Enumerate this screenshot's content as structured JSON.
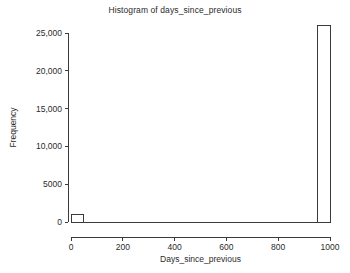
{
  "chart_data": {
    "type": "bar",
    "title": "Histogram of days_since_previous",
    "xlabel": "Days_since_previous",
    "ylabel": "Frequency",
    "xlim": [
      0,
      1000
    ],
    "ylim": [
      0,
      26000
    ],
    "grid": false,
    "legend": "none",
    "bin_width": 50,
    "bar_style": "unfilled outline",
    "xticks": [
      {
        "value": 0,
        "label": "0"
      },
      {
        "value": 200,
        "label": "200"
      },
      {
        "value": 400,
        "label": "400"
      },
      {
        "value": 600,
        "label": "600"
      },
      {
        "value": 800,
        "label": "800"
      },
      {
        "value": 1000,
        "label": "1000"
      }
    ],
    "yticks": [
      {
        "value": 0,
        "label": "0"
      },
      {
        "value": 5000,
        "label": "5000"
      },
      {
        "value": 10000,
        "label": "10,000"
      },
      {
        "value": 15000,
        "label": "15,000"
      },
      {
        "value": 20000,
        "label": "20,000"
      },
      {
        "value": 25000,
        "label": "25,000"
      }
    ],
    "bins": [
      {
        "x0": 0,
        "x1": 50,
        "value": 1000
      },
      {
        "x0": 50,
        "x1": 100,
        "value": 0
      },
      {
        "x0": 100,
        "x1": 150,
        "value": 0
      },
      {
        "x0": 150,
        "x1": 200,
        "value": 0
      },
      {
        "x0": 200,
        "x1": 250,
        "value": 0
      },
      {
        "x0": 250,
        "x1": 300,
        "value": 0
      },
      {
        "x0": 300,
        "x1": 350,
        "value": 0
      },
      {
        "x0": 350,
        "x1": 400,
        "value": 0
      },
      {
        "x0": 400,
        "x1": 450,
        "value": 0
      },
      {
        "x0": 450,
        "x1": 500,
        "value": 0
      },
      {
        "x0": 500,
        "x1": 550,
        "value": 0
      },
      {
        "x0": 550,
        "x1": 600,
        "value": 0
      },
      {
        "x0": 600,
        "x1": 650,
        "value": 0
      },
      {
        "x0": 650,
        "x1": 700,
        "value": 0
      },
      {
        "x0": 700,
        "x1": 750,
        "value": 0
      },
      {
        "x0": 750,
        "x1": 800,
        "value": 0
      },
      {
        "x0": 800,
        "x1": 850,
        "value": 0
      },
      {
        "x0": 850,
        "x1": 900,
        "value": 0
      },
      {
        "x0": 900,
        "x1": 950,
        "value": 0
      },
      {
        "x0": 950,
        "x1": 1000,
        "value": 26000
      }
    ],
    "colors": {
      "background": "#ffffff",
      "axis": "#3a3a3a",
      "text": "#2b2b2b",
      "bar_fill": "#ffffff",
      "bar_stroke": "#3a3a3a"
    }
  }
}
